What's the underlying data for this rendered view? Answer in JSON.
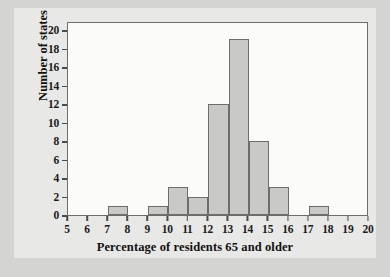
{
  "chart_data": {
    "type": "bar",
    "title": "",
    "subtitle": "",
    "xlabel": "Percentage of residents 65 and older",
    "ylabel": "Number of states",
    "xlim": [
      5,
      20
    ],
    "ylim": [
      0,
      21
    ],
    "grid": false,
    "legend": null,
    "bin_width": 1,
    "x_ticks": [
      5,
      6,
      7,
      8,
      9,
      10,
      11,
      12,
      13,
      14,
      15,
      16,
      17,
      18,
      19,
      20
    ],
    "y_ticks": [
      0,
      2,
      4,
      6,
      8,
      10,
      12,
      14,
      16,
      18,
      20
    ],
    "categories": [
      "5-6",
      "6-7",
      "7-8",
      "8-9",
      "9-10",
      "10-11",
      "11-12",
      "12-13",
      "13-14",
      "14-15",
      "15-16",
      "16-17",
      "17-18",
      "18-19",
      "19-20"
    ],
    "bin_starts": [
      5,
      6,
      7,
      8,
      9,
      10,
      11,
      12,
      13,
      14,
      15,
      16,
      17,
      18,
      19
    ],
    "values": [
      0,
      0,
      1,
      0,
      1,
      3,
      2,
      12,
      19,
      8,
      3,
      0,
      1,
      0,
      0
    ],
    "bar_fill_color": "#c9c9c7",
    "bar_edge_color": "#6d6d6d",
    "frame_color": "#6d6d6d",
    "plot_background": "#fbfbfa",
    "figure_background": "#e8e8e6",
    "page_background": "#d4d4d2",
    "text_color": "#111111"
  }
}
